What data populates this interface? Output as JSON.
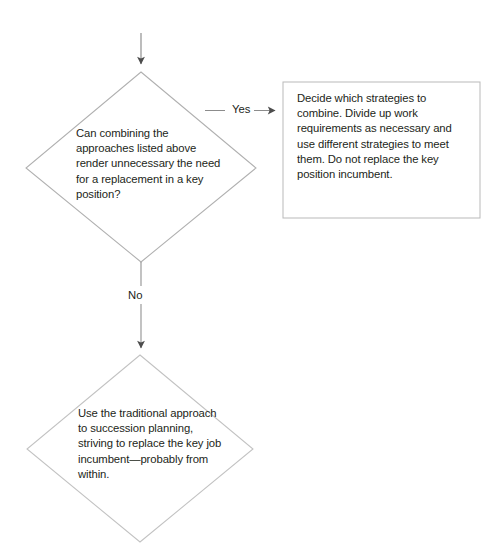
{
  "diagram": {
    "stroke_color": "#9a9a9a",
    "arrow_color": "#6e6e6e",
    "text_color": "#231f20",
    "background_color": "#ffffff"
  },
  "nodes": {
    "entry_arrow": {
      "icon": "down-arrow-icon"
    },
    "decision_primary": {
      "shape": "diamond",
      "text": "Can combining the approaches listed above render unnecessary the need for a replacement in a key position?"
    },
    "process_box": {
      "shape": "rectangle",
      "text": "Decide which strategies to combine. Divide up work requirements as necessary and use different strategies to meet them. Do not replace the key position incumbent."
    },
    "decision_secondary": {
      "shape": "diamond",
      "text": "Use the traditional approach to succession planning, striving to replace the key job incumbent—probably from within."
    }
  },
  "edges": {
    "yes_branch": {
      "label": "Yes",
      "from": "decision_primary",
      "to": "process_box",
      "icon": "right-arrow-icon"
    },
    "no_branch": {
      "label": "No",
      "from": "decision_primary",
      "to": "decision_secondary",
      "icon": "down-arrow-icon"
    }
  }
}
